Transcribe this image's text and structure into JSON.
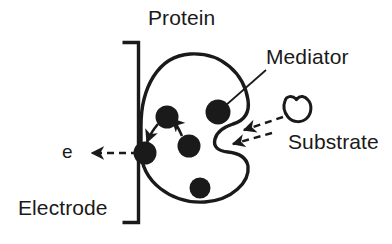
{
  "figure": {
    "width": 392,
    "height": 244,
    "background_color": "#ffffff",
    "ink_color": "#1a1a1a"
  },
  "labels": {
    "protein": "Protein",
    "mediator": "Mediator",
    "substrate": "Substrate",
    "electrode": "Electrode",
    "electron": "e"
  },
  "elements": {
    "electrode_bracket": {
      "name": "electrode-bracket",
      "description": "vertical line with short horizontal arms at top and bottom"
    },
    "protein_body": {
      "name": "protein-outline",
      "description": "kidney-shaped closed outline with a cleft on the right side"
    },
    "substrate_shape": {
      "name": "substrate-outline",
      "description": "small rounded blob with a notch at the top"
    },
    "mediator_dots": [
      {
        "name": "mediator-dot-electrode",
        "cx": 145,
        "cy": 153,
        "r": 11.5
      },
      {
        "name": "mediator-dot-upper-left",
        "cx": 167,
        "cy": 117,
        "r": 11.5
      },
      {
        "name": "mediator-dot-middle",
        "cx": 189,
        "cy": 146,
        "r": 11.5
      },
      {
        "name": "mediator-dot-upper-right",
        "cx": 218,
        "cy": 112,
        "r": 12.5
      },
      {
        "name": "mediator-dot-bottom",
        "cx": 200,
        "cy": 188,
        "r": 10.5
      }
    ],
    "transfer_arrows": [
      {
        "name": "electron-hop-arrow-1",
        "from": "mediator-dot-middle",
        "to": "mediator-dot-upper-left"
      },
      {
        "name": "electron-hop-arrow-2",
        "from": "mediator-dot-upper-left",
        "to": "mediator-dot-electrode"
      }
    ],
    "dashed_arrows": [
      {
        "name": "electron-exit-arrow",
        "direction": "left",
        "label": "e"
      },
      {
        "name": "substrate-binding-arrow-upper",
        "direction": "left"
      },
      {
        "name": "substrate-binding-arrow-lower",
        "direction": "left"
      }
    ],
    "leader_lines": [
      {
        "name": "mediator-leader-line",
        "from_label": "Mediator",
        "to": "mediator-dot-upper-right"
      }
    ]
  }
}
